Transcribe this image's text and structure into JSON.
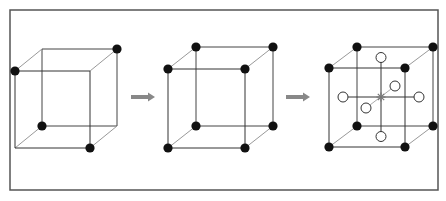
{
  "figure": {
    "panels": [
      {
        "id": "partial-corner-cube",
        "corner_atoms_shown": [
          "front-top-left",
          "back-top-right",
          "back-bottom-left",
          "front-bottom-right"
        ],
        "face_atoms": [],
        "center_marker": false
      },
      {
        "id": "simple-cubic",
        "corner_atoms_shown": [
          "front-top-left",
          "front-top-right",
          "front-bottom-left",
          "front-bottom-right",
          "back-top-left",
          "back-top-right",
          "back-bottom-left",
          "back-bottom-right"
        ],
        "face_atoms": [],
        "center_marker": false
      },
      {
        "id": "cube-with-face-sites",
        "corner_atoms_shown": [
          "front-top-left",
          "front-top-right",
          "front-bottom-left",
          "front-bottom-right",
          "back-top-left",
          "back-top-right",
          "back-bottom-left",
          "back-bottom-right"
        ],
        "face_atoms": [
          "top",
          "bottom",
          "left",
          "right",
          "front",
          "back"
        ],
        "center_marker": true
      }
    ],
    "arrows": [
      {
        "from": "partial-corner-cube",
        "to": "simple-cubic"
      },
      {
        "from": "simple-cubic",
        "to": "cube-with-face-sites"
      }
    ],
    "colors": {
      "corner_atom": "#111111",
      "face_atom_fill": "#ffffff",
      "arrow": "#888888",
      "frame": "#555555"
    }
  }
}
